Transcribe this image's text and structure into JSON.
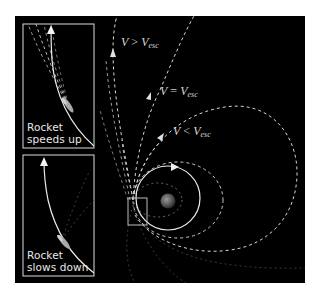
{
  "figure": {
    "background_color": "#000000",
    "line_color": "#e0e0e0",
    "trajectories": [
      {
        "id": "hyperbolic",
        "label": {
          "v": "V",
          "op": ">",
          "sub_v": "V",
          "sub": "esc"
        }
      },
      {
        "id": "parabolic",
        "label": {
          "v": "V",
          "op": "=",
          "sub_v": "V",
          "sub": "esc"
        }
      },
      {
        "id": "elliptical",
        "label": {
          "v": "V",
          "op": "<",
          "sub_v": "V",
          "sub": "esc"
        }
      }
    ],
    "insets": [
      {
        "id": "speeds-up",
        "caption_line1": "Rocket",
        "caption_line2": "speeds up"
      },
      {
        "id": "slows-down",
        "caption_line1": "Rocket",
        "caption_line2": "slows down"
      }
    ],
    "central_body": "planet",
    "circular_orbit": "solid-circle-with-arrow"
  }
}
